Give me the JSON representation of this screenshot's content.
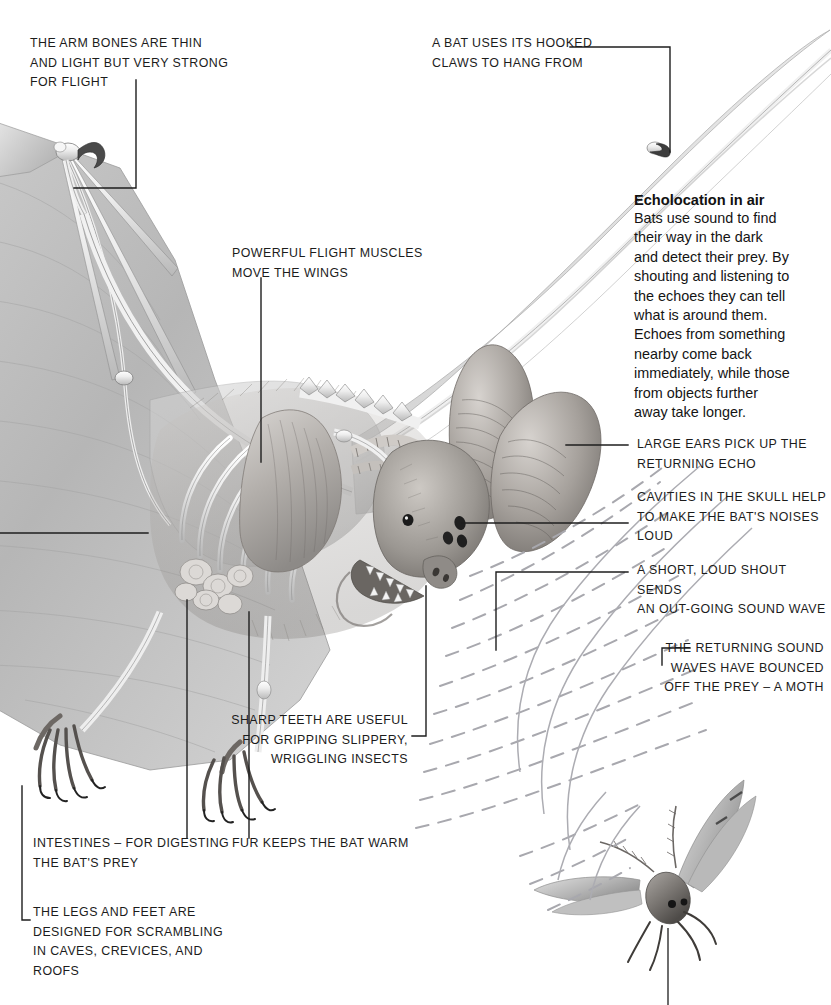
{
  "page": {
    "width": 831,
    "height": 1005,
    "background": "#ffffff",
    "ink": "#1c1c1c",
    "leader_color": "#1e1e1e",
    "wave_color": "#a8a8ae"
  },
  "labels": {
    "arm_bones": "The arm bones are thin\nand light but very strong\nfor flight",
    "hooked_claws": "A bat uses its hooked\nclaws to hang from",
    "flight_muscles": "Powerful flight muscles\nmove the wings",
    "large_ears": "Large ears pick up the\nreturning echo",
    "skull_cavities": "Cavities in the skull help\nto make the bat's noises\nloud",
    "out_going_wave": "A short, loud shout sends\nan out-going sound wave",
    "returning_waves": "The returning sound\nwaves have bounced\noff the prey – a moth",
    "sharp_teeth": "Sharp teeth are useful\nfor gripping slippery,\nwriggling insects",
    "intestines": "Intestines – for digesting\nthe bat's prey",
    "fur": "Fur keeps the bat warm",
    "legs_feet": "The legs and feet are\ndesigned for scrambling\nin caves, crevices, and\nroofs"
  },
  "echolocation_block": {
    "heading": "Echolocation in air",
    "body": "Bats use sound to find\ntheir way in the dark\nand detect their prey. By\nshouting and listening to\nthe echoes they can tell\nwhat is around them.\nEchoes from something\nnearby come back\nimmediately, while those\nfrom objects further\naway take longer."
  },
  "figure_parts": {
    "bat": "bat-illustration",
    "moth": "moth-illustration",
    "outgoing_waves": "dashed-sound-waves",
    "returning_waves": "solid-echo-waves"
  }
}
